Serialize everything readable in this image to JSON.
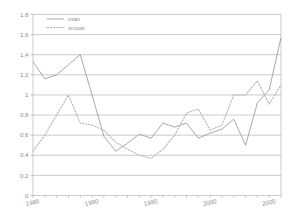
{
  "chart_data": {
    "type": "line",
    "title": "",
    "xlabel": "",
    "ylabel": "",
    "ylim": [
      0,
      1.8
    ],
    "xlim": [
      1985,
      2006
    ],
    "grid": true,
    "legend_position": "top-left",
    "ytick_labels": [
      "1,8",
      "1,6",
      "1,4",
      "1,2",
      "1",
      "0,8",
      "0,6",
      "0,4",
      "0,2",
      "0"
    ],
    "ytick_values": [
      1.8,
      1.6,
      1.4,
      1.2,
      1.0,
      0.8,
      0.6,
      0.4,
      0.2,
      0.0
    ],
    "xtick_labels": [
      "1985",
      "1990",
      "1995",
      "2000",
      "2005"
    ],
    "xtick_values": [
      1985,
      1990,
      1995,
      2000,
      2005
    ],
    "x": [
      1985,
      1986,
      1987,
      1988,
      1989,
      1990,
      1991,
      1992,
      1993,
      1994,
      1995,
      1996,
      1997,
      1998,
      1999,
      2000,
      2001,
      2002,
      2003,
      2004,
      2005,
      2006
    ],
    "series": [
      {
        "name": "man",
        "style": "solid",
        "color": "#9a9a9a",
        "values": [
          1.33,
          1.16,
          1.2,
          1.3,
          1.4,
          1.0,
          0.59,
          0.44,
          0.52,
          0.61,
          0.57,
          0.72,
          0.68,
          0.72,
          0.57,
          0.62,
          0.66,
          0.76,
          0.5,
          0.92,
          1.05,
          1.57
        ]
      },
      {
        "name": "vrouw",
        "style": "dotted",
        "color": "#b4b4b4",
        "values": [
          0.44,
          0.6,
          0.8,
          1.0,
          0.72,
          0.7,
          0.65,
          0.53,
          0.46,
          0.4,
          0.37,
          0.46,
          0.6,
          0.82,
          0.86,
          0.65,
          0.7,
          1.0,
          1.0,
          1.14,
          0.91,
          1.1
        ]
      }
    ]
  },
  "legend": {
    "items": [
      {
        "label": "man"
      },
      {
        "label": "vrouw"
      }
    ]
  }
}
